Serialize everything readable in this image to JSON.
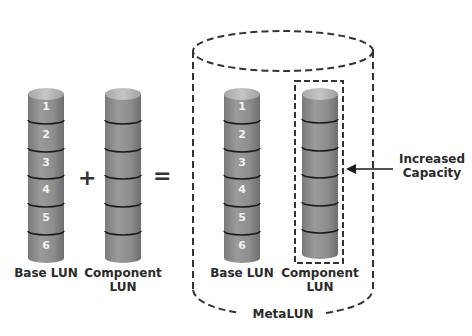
{
  "diagram": {
    "left": {
      "base_lun": {
        "label": "Base LUN",
        "segments": [
          "1",
          "2",
          "3",
          "4",
          "5",
          "6"
        ]
      },
      "operator_plus": "+",
      "component_lun": {
        "label_line1": "Component",
        "label_line2": "LUN",
        "segments": 6
      },
      "operator_equals": "="
    },
    "metalun": {
      "label": "MetaLUN",
      "base_lun": {
        "label": "Base LUN",
        "segments": [
          "1",
          "2",
          "3",
          "4",
          "5",
          "6"
        ]
      },
      "component_lun": {
        "label_line1": "Component",
        "label_line2": "LUN",
        "segments": 6
      },
      "callout": {
        "line1": "Increased",
        "line2": "Capacity"
      }
    },
    "colors": {
      "cylinder_body": "#8c8c8c",
      "cylinder_top": "#b8b8b8",
      "segment_line": "#1a1a1a",
      "dashed_outline": "#333333",
      "text": "#2a2a2a"
    }
  }
}
